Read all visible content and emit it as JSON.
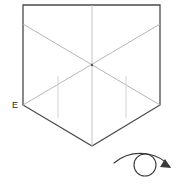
{
  "figure": {
    "background_color": "#ffffff",
    "outline_color": "#4a4a4a",
    "crease_color": "#b8b8b8",
    "crease_color_light": "#d2d2d2",
    "symbol_color": "#3a3a3a"
  },
  "labels": {
    "vertex_e": "E"
  },
  "shape": {
    "name": "pentagon-outline",
    "points": "23,5 160,5 160,105 92,146 23,105",
    "vertices": [
      {
        "name": "top-left",
        "x": 23,
        "y": 5
      },
      {
        "name": "top-right",
        "x": 160,
        "y": 5
      },
      {
        "name": "right-shoulder",
        "x": 160,
        "y": 105
      },
      {
        "name": "bottom-point",
        "x": 92,
        "y": 146
      },
      {
        "name": "left-shoulder-e",
        "x": 23,
        "y": 105
      }
    ]
  },
  "creases": {
    "vertical_center": {
      "name": "center-crease",
      "x1": 92,
      "y1": 5,
      "x2": 92,
      "y2": 146
    },
    "diagonal_down_right": {
      "name": "diagonal-crease-down-right",
      "x1": 23,
      "y1": 24,
      "x2": 160,
      "y2": 105
    },
    "diagonal_down_left": {
      "name": "diagonal-crease-down-left",
      "x1": 160,
      "y1": 24,
      "x2": 23,
      "y2": 105
    },
    "short_vertical_left": {
      "name": "short-crease-left",
      "x1": 58,
      "y1": 76,
      "x2": 58,
      "y2": 118
    },
    "short_vertical_right": {
      "name": "short-crease-right",
      "x1": 126,
      "y1": 76,
      "x2": 126,
      "y2": 118
    },
    "center_dot": {
      "name": "crease-intersection",
      "x": 92,
      "y": 65
    }
  },
  "turn_over_symbol": {
    "name": "turn-over-arrow",
    "meaning": "Turn the model over",
    "circle": {
      "cx": 145,
      "cy": 165,
      "r": 11
    },
    "arc_path": "M 118 161 Q 132 152 152 155 Q 164 158 170 166",
    "arrow_head": "164,160 171,167 161,168"
  }
}
